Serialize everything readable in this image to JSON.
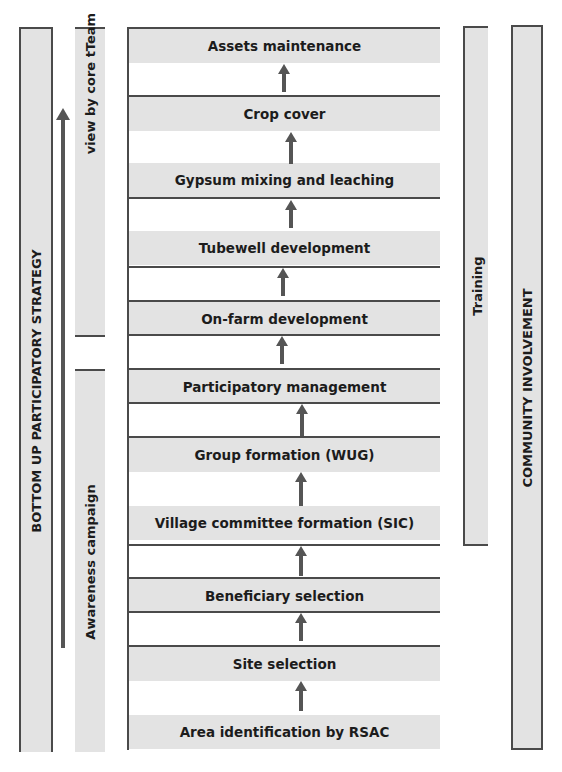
{
  "left_band": {
    "label": "BOTTOM UP PARTICIPATORY STRATEGY"
  },
  "review_band": {
    "label": "Review by core tTeam"
  },
  "awareness_band": {
    "label": "Awareness campaign"
  },
  "training_band": {
    "label": "Training"
  },
  "community_band": {
    "label": "COMMUNITY INVOLVEMENT"
  },
  "steps": [
    {
      "label": "Assets maintenance"
    },
    {
      "label": "Crop cover"
    },
    {
      "label": "Gypsum mixing and leaching"
    },
    {
      "label": "Tubewell development"
    },
    {
      "label": "On-farm development"
    },
    {
      "label": "Participatory management"
    },
    {
      "label": "Group formation (WUG)"
    },
    {
      "label": "Village committee formation (SIC)"
    },
    {
      "label": "Beneficiary selection"
    },
    {
      "label": "Site selection"
    },
    {
      "label": "Area identification by RSAC"
    }
  ],
  "colors": {
    "band_fill": "#e3e3e3",
    "line": "#4a4a4a",
    "arrow": "#555555"
  }
}
